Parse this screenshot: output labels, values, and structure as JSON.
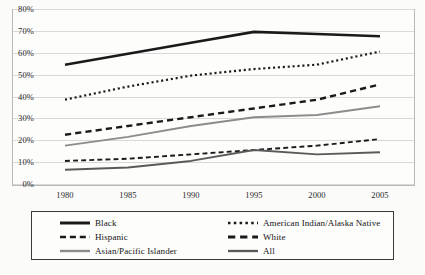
{
  "chart_data": {
    "type": "line",
    "title": "",
    "xlabel": "",
    "ylabel": "",
    "x": [
      1980,
      1985,
      1990,
      1995,
      2000,
      2005
    ],
    "xtick_labels": [
      "1980",
      "1985",
      "1990",
      "1995",
      "2000",
      "2005"
    ],
    "ytick_labels": [
      "0%",
      "10%",
      "20%",
      "30%",
      "40%",
      "50%",
      "60%",
      "70%",
      "80%"
    ],
    "ytick_values": [
      0,
      10,
      20,
      30,
      40,
      50,
      60,
      70,
      80
    ],
    "ylim": [
      0,
      80
    ],
    "xlim": [
      1980,
      2005
    ],
    "grid": true,
    "legend_position": "bottom",
    "series": [
      {
        "name": "Black",
        "values": [
          55,
          60,
          65,
          70,
          69,
          68
        ],
        "style": "solid",
        "color": "#1a1a1a",
        "width": 2.6
      },
      {
        "name": "American Indian/Alaska Native",
        "values": [
          39,
          45,
          50,
          53,
          55,
          61
        ],
        "style": "dotted",
        "color": "#1a1a1a",
        "width": 2.2
      },
      {
        "name": "White",
        "values": [
          23,
          27,
          31,
          35,
          39,
          46
        ],
        "style": "dashed",
        "color": "#1a1a1a",
        "width": 2.4
      },
      {
        "name": "Asian/Pacific Islander",
        "values": [
          18,
          22,
          27,
          31,
          32,
          36
        ],
        "style": "solid",
        "color": "#8c8c8c",
        "width": 2.0
      },
      {
        "name": "Hispanic",
        "values": [
          11,
          12,
          14,
          16,
          18,
          21
        ],
        "style": "dashed",
        "color": "#1a1a1a",
        "width": 1.9
      },
      {
        "name": "All",
        "values": [
          7,
          8,
          11,
          16,
          14,
          15
        ],
        "style": "solid",
        "color": "#5a5a5a",
        "width": 1.9
      }
    ]
  },
  "legend": {
    "columns": [
      [
        "Black",
        "Hispanic",
        "Asian/Pacific Islander"
      ],
      [
        "American Indian/Alaska Native",
        "White",
        "All"
      ]
    ]
  }
}
